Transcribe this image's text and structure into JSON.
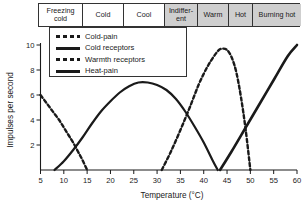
{
  "band": {
    "cells": [
      {
        "label": "Freezing cold",
        "shaded": false,
        "width": 44
      },
      {
        "label": "Cold",
        "shaded": false,
        "width": 41
      },
      {
        "label": "Cool",
        "shaded": false,
        "width": 41
      },
      {
        "label": "Indiffer- ent",
        "shaded": true,
        "width": 33
      },
      {
        "label": "Warm",
        "shaded": true,
        "width": 31
      },
      {
        "label": "Hot",
        "shaded": true,
        "width": 24
      },
      {
        "label": "Burning hot",
        "shaded": true,
        "width": 48
      }
    ]
  },
  "legend": {
    "items": [
      {
        "label": "Cold-pain",
        "style": "dash"
      },
      {
        "label": "Cold receptors",
        "style": "solid"
      },
      {
        "label": "Warmth receptors",
        "style": "dash"
      },
      {
        "label": "Heat-pain",
        "style": "solid-thick"
      }
    ]
  },
  "chart_data": {
    "type": "line",
    "title": "",
    "xlabel": "Temperature (°C)",
    "ylabel": "Impulses per second",
    "xlim": [
      5,
      60
    ],
    "ylim": [
      0,
      10
    ],
    "xticks": [
      5,
      10,
      15,
      20,
      25,
      30,
      35,
      40,
      45,
      50,
      55,
      60
    ],
    "yticks": [
      2,
      4,
      6,
      8,
      10
    ],
    "grid": false,
    "legend_position": "upper-left-inset",
    "series": [
      {
        "name": "Cold-pain",
        "style": "dashed",
        "x": [
          5,
          6,
          7,
          8,
          9,
          10,
          11,
          12,
          13,
          14,
          15
        ],
        "y": [
          6.0,
          5.5,
          5.0,
          4.5,
          4.0,
          3.4,
          2.8,
          2.2,
          1.5,
          0.8,
          0.0
        ]
      },
      {
        "name": "Cold receptors",
        "style": "solid",
        "x": [
          8,
          10,
          12,
          14,
          16,
          18,
          20,
          22,
          24,
          26,
          28,
          30,
          32,
          34,
          36,
          38,
          40,
          42,
          43
        ],
        "y": [
          0.0,
          0.7,
          1.6,
          2.6,
          3.7,
          4.7,
          5.5,
          6.2,
          6.7,
          7.0,
          7.0,
          6.8,
          6.4,
          5.7,
          4.7,
          3.5,
          2.2,
          0.7,
          0.0
        ]
      },
      {
        "name": "Warmth receptors",
        "style": "dashed",
        "x": [
          31,
          33,
          35,
          37,
          39,
          41,
          43,
          44,
          45,
          46,
          47,
          48,
          49,
          50
        ],
        "y": [
          0.0,
          1.5,
          3.2,
          5.0,
          6.9,
          8.4,
          9.5,
          9.7,
          9.6,
          9.0,
          7.8,
          5.8,
          3.2,
          0.0
        ]
      },
      {
        "name": "Heat-pain",
        "style": "solid",
        "x": [
          43.5,
          46,
          49,
          52,
          55,
          58,
          60
        ],
        "y": [
          0.0,
          1.5,
          3.4,
          5.3,
          7.2,
          9.1,
          10.0
        ]
      }
    ]
  }
}
